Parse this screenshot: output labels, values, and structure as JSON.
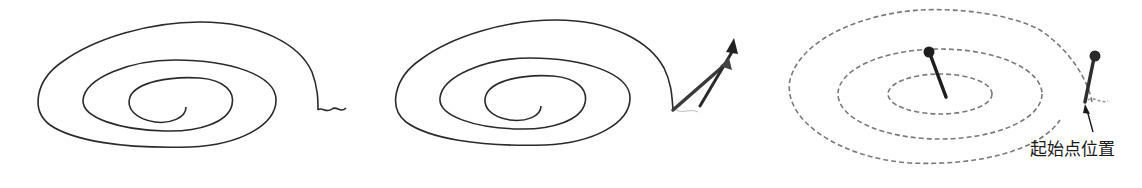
{
  "figure": {
    "panels": [
      {
        "id": "panel-1",
        "description": "solid spiral with squiggle tail at outer end",
        "stroke": "#2a2a2a",
        "center": [
          186,
          107
        ],
        "turns": 3
      },
      {
        "id": "panel-2",
        "description": "solid spiral with pulling arrows at outer end",
        "stroke": "#2a2a2a",
        "center": [
          541,
          106
        ],
        "turns": 3
      },
      {
        "id": "panel-3",
        "description": "dashed spiral with two pins (center and start)",
        "stroke": "#7a7a7a",
        "center": [
          920,
          95
        ],
        "turns": 3
      }
    ],
    "annotation": {
      "label": "起始点位置",
      "position": [
        1030,
        140
      ]
    },
    "colors": {
      "line": "#2a2a2a",
      "dashed": "#808080",
      "pin": "#222222",
      "background": "#ffffff"
    }
  }
}
